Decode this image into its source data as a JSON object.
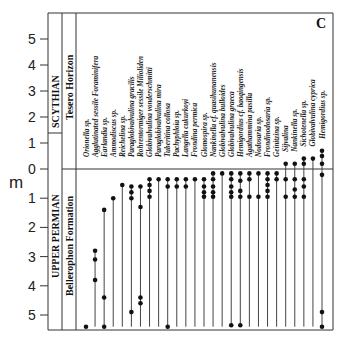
{
  "figure": {
    "panel_label": "C",
    "y_unit": "m",
    "y_ticks_above": [
      "5",
      "4",
      "3",
      "2",
      "1",
      "0"
    ],
    "y_ticks_below": [
      "1",
      "2",
      "3",
      "4",
      "5"
    ],
    "stratigraphy": {
      "upper_stage": "SCYTHIAN",
      "upper_unit": "Tesero Horizon",
      "lower_stage": "UPPER PERMIAN",
      "lower_unit": "Bellerophon Formation"
    }
  },
  "chart_data": {
    "type": "range-chart",
    "title": "",
    "panel": "C",
    "ylabel": "m",
    "y_axis_note": "Metres above (positive) and below (depth) the Permian–Triassic boundary at 0",
    "ylim_above": [
      0,
      5.8
    ],
    "ylim_below": [
      0,
      5.5
    ],
    "boundary_at": 0,
    "units": [
      {
        "name": "SCYTHIAN / Tesero Horizon",
        "range_m": "0 to 5.8 above"
      },
      {
        "name": "UPPER PERMIAN / Bellerophon Formation",
        "range_m": "0 to 5.5 below"
      }
    ],
    "taxa": [
      {
        "name": "Orionella sp.",
        "bottom": -5.4,
        "top": -5.4,
        "points": [
          -5.4
        ]
      },
      {
        "name": "Agglutinated sessile Foraminifera",
        "bottom": -5.4,
        "top": -2.8,
        "points": [
          -2.8,
          -3.1,
          -3.8
        ]
      },
      {
        "name": "Earlandia sp.",
        "bottom": -5.4,
        "top": -1.4,
        "points": [
          -1.4,
          -4.4,
          -5.4
        ]
      },
      {
        "name": "Ammodiscus sp.",
        "bottom": -5.4,
        "top": -1.0,
        "points": [
          -1.0
        ]
      },
      {
        "name": "Reichelina sp.",
        "bottom": -5.4,
        "top": -0.55,
        "points": [
          -0.55
        ]
      },
      {
        "name": "Paraglobivalvulina gracilis",
        "bottom": -5.4,
        "top": -0.6,
        "points": [
          -0.6,
          -0.8,
          -1.0,
          -4.9
        ]
      },
      {
        "name": "Rohrentormiger sessile Milioliden",
        "bottom": -5.4,
        "top": -0.6,
        "points": [
          -0.6,
          -1.3,
          -4.4,
          -4.6
        ]
      },
      {
        "name": "Globivalvulina vonderschmitti",
        "bottom": -5.4,
        "top": -0.35,
        "points": [
          -0.35,
          -0.55,
          -0.75,
          -0.95
        ]
      },
      {
        "name": "Paraglobivalvulina mira",
        "bottom": -5.4,
        "top": -0.35,
        "points": [
          -0.35
        ]
      },
      {
        "name": "Tuberitina collosa",
        "bottom": -5.4,
        "top": -0.35,
        "points": [
          -0.35,
          -0.6,
          -5.4
        ]
      },
      {
        "name": "Pachyphloia sp.",
        "bottom": -5.4,
        "top": -0.35,
        "points": [
          -0.35,
          -0.6
        ]
      },
      {
        "name": "Langella cukurkoyi",
        "bottom": -5.4,
        "top": -0.35,
        "points": [
          -0.35,
          -0.6
        ]
      },
      {
        "name": "Frondina permica",
        "bottom": -5.4,
        "top": -0.35,
        "points": [
          -0.35
        ]
      },
      {
        "name": "Glomospira sp.",
        "bottom": -5.4,
        "top": -0.35,
        "points": [
          -0.35,
          -0.6,
          -0.8,
          -0.95
        ]
      },
      {
        "name": "Nankinella cf. quasihunanensis",
        "bottom": -5.4,
        "top": -0.15,
        "points": [
          -0.15,
          -0.35,
          -0.6,
          -0.8,
          -0.95
        ]
      },
      {
        "name": "Globivalvulina bulloides",
        "bottom": -5.4,
        "top": -0.15,
        "points": [
          -0.15
        ]
      },
      {
        "name": "Globivalvulina graeca",
        "bottom": -5.4,
        "top": -0.15,
        "points": [
          -0.15,
          -0.35,
          -0.6,
          -0.8,
          -0.95,
          -5.35
        ]
      },
      {
        "name": "Hemigordius cf. baoqingensis",
        "bottom": -5.4,
        "top": -0.15,
        "points": [
          -0.15,
          -0.4,
          -0.75,
          -0.95,
          -5.35
        ]
      },
      {
        "name": "Agathammina pusilla",
        "bottom": -5.4,
        "top": -0.15,
        "points": [
          -0.15,
          -0.35,
          -0.95
        ]
      },
      {
        "name": "Nodosaria sp.",
        "bottom": -5.4,
        "top": -0.15,
        "points": [
          -0.15,
          -0.95
        ]
      },
      {
        "name": "Frondinodosaria sp.",
        "bottom": -5.4,
        "top": -0.15,
        "points": [
          -0.15,
          -0.35,
          -0.55,
          -0.75,
          -0.95
        ]
      },
      {
        "name": "Geinitzina sp.",
        "bottom": -5.4,
        "top": -0.15,
        "points": [
          -0.15,
          -0.35
        ]
      },
      {
        "name": "Sijvalina",
        "bottom": -5.4,
        "top": 0.2,
        "points": [
          0.2,
          -0.35,
          -0.95
        ]
      },
      {
        "name": "Nankinella sp.",
        "bottom": -5.4,
        "top": 0.2,
        "points": [
          0.2,
          -0.35,
          -0.7,
          -0.95
        ]
      },
      {
        "name": "Sichotenella sp.",
        "bottom": -5.4,
        "top": 0.4,
        "points": [
          0.4,
          0.2,
          -0.35,
          -0.6,
          -0.95
        ]
      },
      {
        "name": "Globivalvulina cyprica",
        "bottom": -5.4,
        "top": 0.4,
        "points": [
          0.4
        ]
      },
      {
        "name": "Hemigordius sp.",
        "bottom": -5.4,
        "top": 0.7,
        "points": [
          0.7,
          0.5,
          0.2,
          -0.2,
          -4.9,
          -5.4
        ]
      }
    ]
  }
}
